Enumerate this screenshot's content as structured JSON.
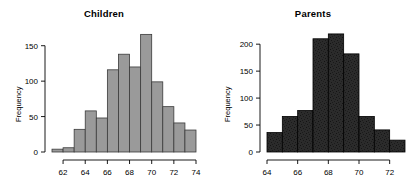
{
  "figure": {
    "background": "#ffffff",
    "panel_count": 2
  },
  "chart_data": [
    {
      "type": "bar",
      "title": "Children",
      "xlabel": "",
      "ylabel": "Frequency",
      "bar_fill": "#9a9a9a",
      "bar_edge": "#3a3a3a",
      "grid": false,
      "legend": null,
      "xlim": [
        61,
        74
      ],
      "ylim": [
        0,
        175
      ],
      "xticks": [
        62,
        64,
        66,
        68,
        70,
        72,
        74
      ],
      "xtick_labels": [
        "62",
        "64",
        "66",
        "68",
        "70",
        "72",
        "74"
      ],
      "yticks": [
        0,
        50,
        100,
        150
      ],
      "ytick_labels": [
        "0",
        "50",
        "100",
        "150"
      ],
      "bin_edges": [
        61,
        62,
        63,
        64,
        65,
        66,
        67,
        68,
        69,
        70,
        71,
        72,
        73,
        74
      ],
      "categories": [
        "61-62",
        "62-63",
        "63-64",
        "64-65",
        "65-66",
        "66-67",
        "67-68",
        "68-69",
        "69-70",
        "70-71",
        "71-72",
        "72-73",
        "73-74"
      ],
      "values": [
        4,
        6,
        32,
        58,
        48,
        116,
        138,
        120,
        166,
        99,
        64,
        41,
        31
      ]
    },
    {
      "type": "bar",
      "title": "Parents",
      "xlabel": "",
      "ylabel": "Frequency",
      "bar_fill": "#2b2b2b",
      "bar_edge": "#000000",
      "grid": false,
      "legend": null,
      "xlim": [
        64,
        73
      ],
      "ylim": [
        0,
        230
      ],
      "xticks": [
        64,
        66,
        68,
        70,
        72
      ],
      "xtick_labels": [
        "64",
        "66",
        "68",
        "70",
        "72"
      ],
      "yticks": [
        0,
        50,
        100,
        150,
        200
      ],
      "ytick_labels": [
        "0",
        "50",
        "100",
        "150",
        "200"
      ],
      "bin_edges": [
        64,
        65,
        66,
        67,
        68,
        69,
        70,
        71,
        72,
        73
      ],
      "categories": [
        "64-65",
        "65-66",
        "66-67",
        "67-68",
        "68-69",
        "69-70",
        "70-71",
        "71-72",
        "72-73"
      ],
      "values": [
        36,
        66,
        77,
        210,
        219,
        182,
        66,
        41,
        22
      ]
    }
  ]
}
